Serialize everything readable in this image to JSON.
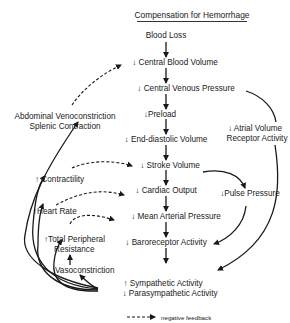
{
  "title": "Compensation for Hemorrhage",
  "nodes": {
    "blood_loss": "Blood Loss",
    "central_blood_volume": "↓ Central Blood Volume",
    "central_venous_pressure": "↓ Central Venous Pressure",
    "preload": "↓Preload",
    "end_diastolic_volume": "↓ End-diastolic Volume",
    "stroke_volume": "↓ Stroke Volume",
    "cardiac_output": "↓ Cardiac Output",
    "mean_arterial_pressure": "↓ Mean Arterial Pressure",
    "baroreceptor_activity": "↓ Baroreceptor Activity",
    "sympathetic_activity": "↑ Sympathetic Activity",
    "parasympathetic_activity": "↓ Parasympathetic Activity",
    "pulse_pressure": "↓Pulse Pressure",
    "atrial_volume_line1": "↓ Atrial Volume",
    "atrial_volume_line2": "Receptor Activity",
    "abdominal_line1": "Abdominal Venoconstriction",
    "abdominal_line2": "Splenic Contraction",
    "contractility": "↑ Contractility",
    "heart_rate": "↑Heart Rate",
    "tpr_line1": "↑Total Peripheral",
    "tpr_line2": "Resistance",
    "vasoconstriction": "Vasoconstriction"
  },
  "legend": {
    "negative_feedback": "negative feedback"
  },
  "colors": {
    "line": "#1a1a1a",
    "background": "#ffffff"
  }
}
